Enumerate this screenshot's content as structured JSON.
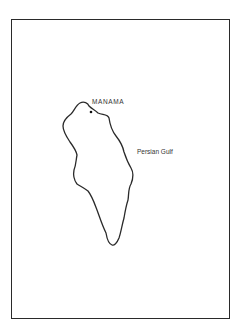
{
  "map": {
    "colors": {
      "outline": "#2a2a2a",
      "background": "#ffffff",
      "text": "#333333"
    },
    "island_outline": "M80,103 C84,101 88,103 89,106 C92,109 95,110 98,113 C103,115 108,114 109,118 C110,125 112,131 116,136 C120,141 123,147 124,152 C126,158 128,163 131,168 C134,173 133,179 131,184 C128,189 129,194 128,200 C126,206 125,212 124,218 C122,225 121,232 119,238 C117,243 114,246 112,245 C109,244 107,239 106,233 C102,225 100,218 97,210 C94,202 92,196 88,191 C84,188 80,186 77,184 C74,180 73,175 74,170 C76,165 76,160 77,155 C76,150 73,146 70,142 C66,136 63,131 63,126 C63,121 67,117 71,114 C74,111 76,105 80,103 Z",
    "city_dot": {
      "x": 91,
      "y": 112
    },
    "labels": {
      "capital": "MANAMA",
      "sea": "Persian Gulf"
    }
  }
}
